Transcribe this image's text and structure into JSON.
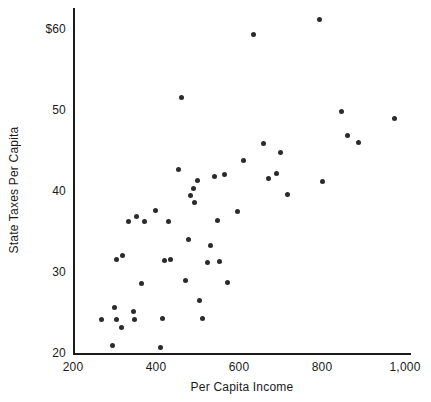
{
  "chart_data": {
    "type": "scatter",
    "title": "",
    "xlabel": "Per Capita Income",
    "ylabel": "State Taxes Per Capita",
    "xlim": [
      200,
      1000
    ],
    "ylim": [
      20,
      61
    ],
    "grid": false,
    "legend": null,
    "x_ticks": [
      {
        "value": 200,
        "label": "200"
      },
      {
        "value": 400,
        "label": "400"
      },
      {
        "value": 600,
        "label": "600"
      },
      {
        "value": 800,
        "label": "800"
      },
      {
        "value": 1000,
        "label": "1,000"
      }
    ],
    "y_ticks": [
      {
        "value": 20,
        "label": "20"
      },
      {
        "value": 30,
        "label": "30"
      },
      {
        "value": 40,
        "label": "40"
      },
      {
        "value": 50,
        "label": "50"
      },
      {
        "value": 60,
        "label": "$60"
      }
    ],
    "marker": {
      "shape": "circle",
      "color": "#2b2b2b",
      "size": 5
    },
    "axis_color": "#1a1a1a",
    "points": [
      {
        "x": 269,
        "y": 24.1
      },
      {
        "x": 296,
        "y": 20.9
      },
      {
        "x": 301,
        "y": 25.6
      },
      {
        "x": 305,
        "y": 24.1
      },
      {
        "x": 306,
        "y": 31.6
      },
      {
        "x": 316,
        "y": 23.2
      },
      {
        "x": 320,
        "y": 32.0
      },
      {
        "x": 333,
        "y": 36.2
      },
      {
        "x": 345,
        "y": 25.1
      },
      {
        "x": 348,
        "y": 24.1
      },
      {
        "x": 352,
        "y": 36.8
      },
      {
        "x": 364,
        "y": 28.6
      },
      {
        "x": 372,
        "y": 36.2
      },
      {
        "x": 398,
        "y": 37.6
      },
      {
        "x": 410,
        "y": 20.7
      },
      {
        "x": 416,
        "y": 24.3
      },
      {
        "x": 420,
        "y": 31.4
      },
      {
        "x": 430,
        "y": 36.2
      },
      {
        "x": 436,
        "y": 31.5
      },
      {
        "x": 455,
        "y": 42.7
      },
      {
        "x": 462,
        "y": 51.5
      },
      {
        "x": 470,
        "y": 28.9
      },
      {
        "x": 478,
        "y": 34.0
      },
      {
        "x": 484,
        "y": 39.4
      },
      {
        "x": 491,
        "y": 40.3
      },
      {
        "x": 493,
        "y": 38.6
      },
      {
        "x": 500,
        "y": 41.3
      },
      {
        "x": 505,
        "y": 26.5
      },
      {
        "x": 512,
        "y": 24.2
      },
      {
        "x": 524,
        "y": 31.2
      },
      {
        "x": 532,
        "y": 33.3
      },
      {
        "x": 540,
        "y": 41.8
      },
      {
        "x": 548,
        "y": 36.3
      },
      {
        "x": 552,
        "y": 31.3
      },
      {
        "x": 565,
        "y": 42.0
      },
      {
        "x": 572,
        "y": 28.7
      },
      {
        "x": 596,
        "y": 37.5
      },
      {
        "x": 610,
        "y": 43.8
      },
      {
        "x": 634,
        "y": 59.3
      },
      {
        "x": 660,
        "y": 45.9
      },
      {
        "x": 672,
        "y": 41.6
      },
      {
        "x": 690,
        "y": 42.2
      },
      {
        "x": 700,
        "y": 44.8
      },
      {
        "x": 718,
        "y": 39.6
      },
      {
        "x": 793,
        "y": 61.2
      },
      {
        "x": 800,
        "y": 41.2
      },
      {
        "x": 848,
        "y": 49.8
      },
      {
        "x": 862,
        "y": 46.8
      },
      {
        "x": 888,
        "y": 46.0
      },
      {
        "x": 975,
        "y": 48.9
      }
    ]
  }
}
